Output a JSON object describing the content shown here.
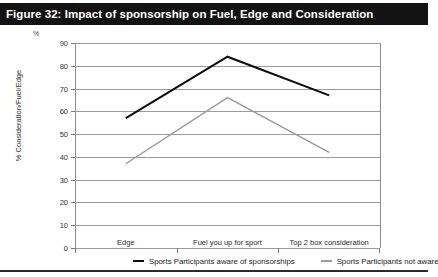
{
  "figure": {
    "title": "Figure 32: Impact of sponsorship on Fuel, Edge and Consideration"
  },
  "chart_data": {
    "type": "line",
    "title": "Figure 32: Impact of sponsorship on Fuel, Edge and Consideration",
    "xlabel": "",
    "ylabel": "% Consideration/Fuel/Edge",
    "unit_label": "%",
    "categories": [
      "Edge",
      "Fuel you up for sport",
      "Top 2 box consideration"
    ],
    "series": [
      {
        "name": "Sports Participants aware of sponsorships",
        "color": "#0d0d0d",
        "values": [
          57,
          84,
          67
        ]
      },
      {
        "name": "Sports Participants not aware",
        "color": "#9a9a9a",
        "values": [
          37,
          66,
          42
        ]
      }
    ],
    "ylim": [
      0,
      90
    ],
    "ytick_step": 10,
    "yticks": [
      90,
      80,
      70,
      60,
      50,
      40,
      30,
      20,
      10,
      0
    ],
    "grid": true,
    "legend_position": "bottom"
  }
}
